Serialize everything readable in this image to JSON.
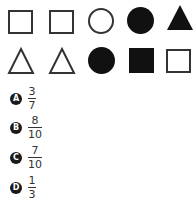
{
  "shapes": {
    "row1": [
      "square-outline",
      "square-outline",
      "circle-outline",
      "circle-filled",
      "triangle-filled"
    ],
    "row2": [
      "triangle-outline",
      "triangle-outline",
      "circle-filled",
      "square-filled",
      "square-outline"
    ]
  },
  "options": [
    {
      "letter": "A",
      "numerator": "3",
      "denominator": "7"
    },
    {
      "letter": "B",
      "numerator": "8",
      "denominator": "10"
    },
    {
      "letter": "C",
      "numerator": "7",
      "denominator": "10"
    },
    {
      "letter": "D",
      "numerator": "1",
      "denominator": "3"
    }
  ]
}
